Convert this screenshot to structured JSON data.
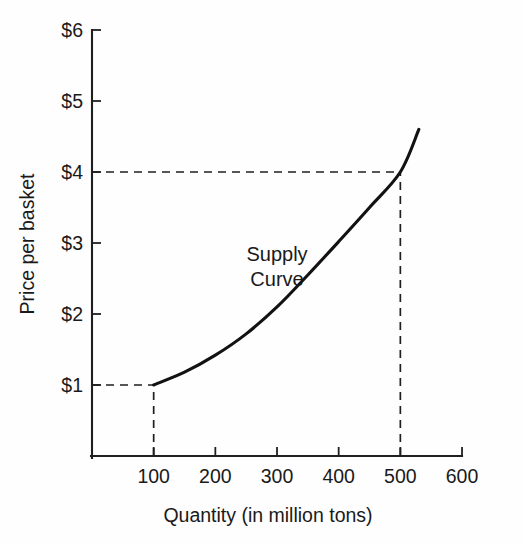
{
  "chart_data": {
    "type": "line",
    "title": "",
    "subtitle": "",
    "xlabel": "Quantity (in million tons)",
    "ylabel": "Price per basket",
    "xlim": [
      0,
      600
    ],
    "ylim": [
      0,
      6
    ],
    "grid": false,
    "legend": null,
    "series": [
      {
        "name": "Supply Curve",
        "points": [
          {
            "x": 100,
            "y": 1.0
          },
          {
            "x": 150,
            "y": 1.18
          },
          {
            "x": 200,
            "y": 1.42
          },
          {
            "x": 250,
            "y": 1.72
          },
          {
            "x": 300,
            "y": 2.1
          },
          {
            "x": 350,
            "y": 2.55
          },
          {
            "x": 400,
            "y": 3.02
          },
          {
            "x": 450,
            "y": 3.5
          },
          {
            "x": 500,
            "y": 4.0
          },
          {
            "x": 530,
            "y": 4.6
          }
        ]
      }
    ],
    "annotations": [
      {
        "name": "supply-curve-label",
        "line1": "Supply",
        "line2": "Curve",
        "x": 300,
        "y": 2.75
      }
    ],
    "reference_lines": [
      {
        "name": "price-1-guide",
        "axis": "y",
        "value": 1.0,
        "style": "dashed",
        "from_x": 0,
        "to_x": 100
      },
      {
        "name": "quantity-100-guide",
        "axis": "x",
        "value": 100,
        "style": "dashed",
        "from_y": 0,
        "to_y": 1.0
      },
      {
        "name": "price-4-guide",
        "axis": "y",
        "value": 4.0,
        "style": "dashed",
        "from_x": 0,
        "to_x": 500
      },
      {
        "name": "quantity-500-guide",
        "axis": "x",
        "value": 500,
        "style": "dashed",
        "from_y": 0,
        "to_y": 4.0
      }
    ],
    "y_ticks": [
      {
        "value": 1,
        "label": "$1"
      },
      {
        "value": 2,
        "label": "$2"
      },
      {
        "value": 3,
        "label": "$3"
      },
      {
        "value": 4,
        "label": "$4"
      },
      {
        "value": 5,
        "label": "$5"
      },
      {
        "value": 6,
        "label": "$6"
      }
    ],
    "x_ticks": [
      {
        "value": 100,
        "label": "100"
      },
      {
        "value": 200,
        "label": "200"
      },
      {
        "value": 300,
        "label": "300"
      },
      {
        "value": 400,
        "label": "400"
      },
      {
        "value": 500,
        "label": "500"
      },
      {
        "value": 600,
        "label": "600"
      }
    ],
    "colors": {
      "curve": "#121212",
      "axis": "#1f1f1f",
      "guide": "#1f1f1f",
      "text": "#1a1a1a",
      "background": "#fefefe"
    }
  }
}
